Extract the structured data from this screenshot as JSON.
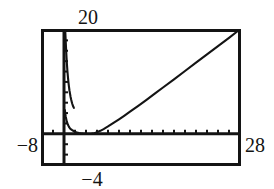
{
  "figure": {
    "kind": "graphing-calculator-viewport",
    "background_color": "#ffffff",
    "ink_color": "#141414",
    "frame": {
      "x": 42,
      "y": 30,
      "width": 198,
      "height": 135
    }
  },
  "labels": {
    "x_min": "−8",
    "x_max": "28",
    "y_max": "20",
    "x_origin": "−4"
  },
  "chart_data": {
    "type": "line",
    "title": "",
    "xlabel": "",
    "ylabel": "",
    "xlim": [
      -8,
      28
    ],
    "ylim": [
      -6,
      20
    ],
    "grid": false,
    "legend": null,
    "axis_style": {
      "x_axis_value": 0,
      "y_axis_value": -4,
      "tick_spacing_x": 2,
      "tick_spacing_y": 2,
      "tick_length_px": 4,
      "ticks_visible": true
    },
    "annotations": [
      {
        "text": "20",
        "role": "y-axis-max-label",
        "position": "top-above-y-axis"
      },
      {
        "text": "−8",
        "role": "x-axis-min-label",
        "position": "left-of-frame"
      },
      {
        "text": "28",
        "role": "x-axis-max-label",
        "position": "right-of-frame"
      },
      {
        "text": "−4",
        "role": "x-axis-origin-label",
        "position": "below-y-axis"
      }
    ],
    "series": [
      {
        "name": "curve",
        "description": "Branch left of minimum rises steeply toward vertical asymptote near x = -4",
        "x": [
          -3.78,
          -3.72,
          -3.66,
          -3.6,
          -3.54,
          -3.46,
          -3.38,
          -3.3,
          -3.2,
          -3.1,
          -3.0,
          -2.9,
          -2.8,
          -2.7,
          -2.6,
          -2.5,
          -2.4,
          -2.3,
          -2.2
        ],
        "y": [
          20.0,
          18.6,
          17.2,
          15.9,
          14.7,
          13.3,
          12.1,
          11.1,
          10.0,
          9.1,
          8.3,
          7.7,
          7.1,
          6.6,
          6.2,
          5.8,
          5.5,
          5.2,
          5.0
        ]
      },
      {
        "name": "curve-main",
        "description": "Main branch: descends from asymptote, minimum near x = 0.5 just above the x-axis, then rises nearly linearly to upper right corner",
        "x": [
          -3.85,
          -3.7,
          -3.5,
          -3.3,
          -3.1,
          -2.9,
          -2.7,
          -2.5,
          -2.2,
          -1.9,
          -1.6,
          -1.3,
          -1.0,
          -0.6,
          -0.2,
          0.2,
          0.6,
          1.0,
          1.5,
          2.0,
          2.6,
          3.2,
          4.0,
          5.0,
          6.0,
          7.0,
          8.0,
          9.5,
          11.0,
          12.5,
          14.0,
          16.0,
          18.0,
          20.0,
          22.0,
          24.0,
          26.0,
          27.6
        ],
        "y": [
          4.6,
          3.4,
          2.4,
          1.8,
          1.35,
          1.05,
          0.85,
          0.7,
          0.5,
          0.36,
          0.24,
          0.16,
          0.1,
          0.04,
          0.0,
          -0.02,
          -0.02,
          0.0,
          0.12,
          0.3,
          0.58,
          0.92,
          1.42,
          2.1,
          2.8,
          3.52,
          4.26,
          5.4,
          6.56,
          7.74,
          8.92,
          10.5,
          12.1,
          13.7,
          15.3,
          16.9,
          18.5,
          19.8
        ]
      }
    ]
  }
}
